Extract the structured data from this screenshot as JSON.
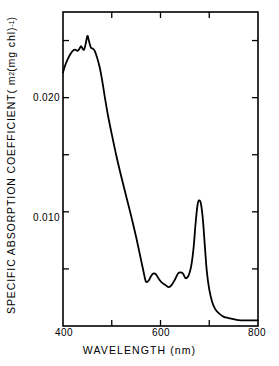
{
  "chart_data": {
    "type": "line",
    "title": "",
    "xlabel": "WAVELENGTH  (nm)",
    "ylabel": "SPECIFIC  ABSORPTION  COEFFICIENT",
    "ylabel_units_prefix": "  ( m",
    "ylabel_units_sup1": "2",
    "ylabel_units_mid": " (mg chl)",
    "ylabel_units_sup2": "-1",
    "ylabel_units_suffix": " )",
    "xlim": [
      400,
      800
    ],
    "ylim": [
      0.0,
      0.0275
    ],
    "grid": false,
    "legend": null,
    "xticks": [
      400,
      500,
      600,
      700,
      800
    ],
    "xtick_labels": [
      "400",
      "",
      "600",
      "",
      "800"
    ],
    "yticks": [
      0.005,
      0.01,
      0.015,
      0.02,
      0.025
    ],
    "ytick_labels": [
      "",
      "0.010",
      "",
      "0.020",
      ""
    ],
    "line_color": "#000000",
    "line_width": 1.8,
    "axis_color": "#000000",
    "background_color": "#ffffff",
    "series": [
      {
        "name": "specific absorption coefficient",
        "x": [
          400,
          405,
          410,
          415,
          420,
          425,
          430,
          434,
          437,
          440,
          443,
          446,
          450,
          453,
          457,
          461,
          465,
          470,
          475,
          480,
          486,
          492,
          500,
          510,
          520,
          530,
          540,
          550,
          558,
          565,
          570,
          576,
          581,
          586,
          591,
          597,
          603,
          610,
          617,
          623,
          630,
          636,
          641,
          646,
          651,
          656,
          660,
          664,
          668,
          672,
          676,
          679,
          683,
          687,
          691,
          695,
          700,
          706,
          712,
          720,
          730,
          740,
          750,
          765,
          780,
          800
        ],
        "y": [
          0.0222,
          0.0229,
          0.0234,
          0.0238,
          0.0241,
          0.0242,
          0.0241,
          0.0243,
          0.0245,
          0.0243,
          0.0242,
          0.0246,
          0.0254,
          0.025,
          0.0244,
          0.0243,
          0.0241,
          0.0235,
          0.0227,
          0.0216,
          0.02,
          0.0185,
          0.0168,
          0.0148,
          0.013,
          0.0113,
          0.0096,
          0.0078,
          0.0062,
          0.0048,
          0.0039,
          0.004,
          0.0044,
          0.0046,
          0.0045,
          0.0041,
          0.0038,
          0.0036,
          0.0034,
          0.0036,
          0.0041,
          0.0046,
          0.0047,
          0.0046,
          0.0042,
          0.0043,
          0.0047,
          0.0055,
          0.0069,
          0.009,
          0.0106,
          0.011,
          0.0107,
          0.0093,
          0.007,
          0.0048,
          0.0032,
          0.0021,
          0.0015,
          0.0011,
          0.0008,
          0.0007,
          0.0006,
          0.0005,
          0.0005,
          0.0005
        ]
      }
    ],
    "features": {
      "soret_main_peak_nm": 450,
      "soret_main_peak_value": 0.0254,
      "soret_secondary_peak_nm": 437,
      "soret_secondary_peak_value": 0.0245,
      "qy_peak_nm": 678,
      "qy_peak_value": 0.011,
      "green_minimum_nm": 617,
      "green_minimum_value": 0.0034,
      "value_at_400nm": 0.0222,
      "value_at_800nm": 0.0005
    }
  },
  "axes": {
    "frame": {
      "left": 63,
      "top": 12,
      "right": 258,
      "bottom": 326
    }
  }
}
